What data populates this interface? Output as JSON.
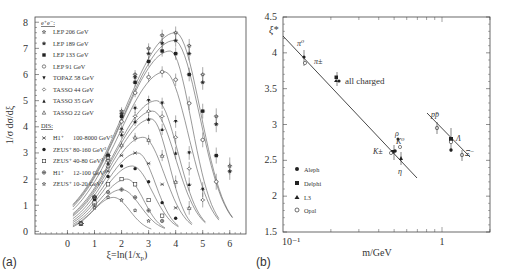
{
  "chart_data": [
    {
      "panel": "(a)",
      "type": "scatter",
      "title": "",
      "xlabel": "ξ=ln(1/x_p)",
      "ylabel": "1/σ dσ/dξ",
      "xlim": [
        -1.2,
        6.6
      ],
      "ylim": [
        0,
        8
      ],
      "x_ticks": [
        "0",
        "1",
        "2",
        "3",
        "4",
        "5",
        "6"
      ],
      "y_ticks": [
        "0",
        "1",
        "2",
        "3",
        "4",
        "5",
        "6",
        "7",
        "8"
      ],
      "grid": false,
      "legend_position": "upper-left",
      "legend_groups": [
        {
          "heading": "e⁺e⁻:",
          "entries": [
            {
              "marker": "star-open",
              "label": "LEP 206 GeV"
            },
            {
              "marker": "star-filled",
              "label": "LEP 189 GeV"
            },
            {
              "marker": "square-filled",
              "label": "LEP 133 GeV"
            },
            {
              "marker": "circle-open",
              "label": "LEP 91 GeV"
            },
            {
              "marker": "triangle-down-filled",
              "label": "TOPAZ 58 GeV"
            },
            {
              "marker": "diamond-open",
              "label": "TASSO 44 GeV"
            },
            {
              "marker": "triangle-up-filled",
              "label": "TASSO 35 GeV"
            },
            {
              "marker": "triangle-up-open",
              "label": "TASSO 22 GeV"
            }
          ]
        },
        {
          "heading": "DIS:",
          "entries": [
            {
              "marker": "asterisk",
              "label": "H1⁺",
              "range": "100-8000 GeV²"
            },
            {
              "marker": "circle-filled",
              "label": "ZEUS⁺",
              "range": "80-160 GeV²"
            },
            {
              "marker": "square-open",
              "label": "ZEUS⁺",
              "range": "40-80 GeV²"
            },
            {
              "marker": "cross-open",
              "label": "H1⁺",
              "range": "12-100 GeV²"
            },
            {
              "marker": "star-open",
              "label": "ZEUS⁺",
              "range": "10-20 GeV²"
            }
          ]
        }
      ],
      "series": [
        {
          "name": "LEP 206 GeV",
          "peak_x": 4.0,
          "peak_y": 7.6,
          "x": [
            0.5,
            1.0,
            1.5,
            2.0,
            2.5,
            3.0,
            3.5,
            4.0,
            4.5,
            5.0,
            5.5,
            6.0
          ],
          "y": [
            0.3,
            1.3,
            2.9,
            4.6,
            6.0,
            7.0,
            7.5,
            7.6,
            7.1,
            6.0,
            4.4,
            2.5
          ]
        },
        {
          "name": "LEP 189 GeV",
          "peak_x": 3.95,
          "peak_y": 7.3,
          "x": [
            0.5,
            1.0,
            1.5,
            2.0,
            2.5,
            3.0,
            3.5,
            4.0,
            4.5,
            5.0,
            5.5,
            6.0
          ],
          "y": [
            0.3,
            1.3,
            2.9,
            4.5,
            5.9,
            6.8,
            7.2,
            7.3,
            6.8,
            5.7,
            4.1,
            2.3
          ]
        },
        {
          "name": "LEP 133 GeV",
          "peak_x": 3.8,
          "peak_y": 6.9,
          "x": [
            0.5,
            1.0,
            1.5,
            2.0,
            2.5,
            3.0,
            3.5,
            4.0,
            4.5,
            5.0,
            5.5
          ],
          "y": [
            0.3,
            1.3,
            2.9,
            4.4,
            5.7,
            6.5,
            6.9,
            6.8,
            6.0,
            4.6,
            2.9
          ]
        },
        {
          "name": "LEP 91 GeV",
          "peak_x": 3.6,
          "peak_y": 6.1,
          "x": [
            0.5,
            1.0,
            1.5,
            2.0,
            2.5,
            3.0,
            3.5,
            4.0,
            4.5,
            5.0,
            5.5
          ],
          "y": [
            0.3,
            1.3,
            2.8,
            4.2,
            5.3,
            5.9,
            6.1,
            5.8,
            4.9,
            3.5,
            1.9
          ]
        },
        {
          "name": "TOPAZ 58 GeV",
          "peak_x": 3.3,
          "peak_y": 5.0,
          "x": [
            0.5,
            1.0,
            1.5,
            2.0,
            2.5,
            3.0,
            3.5,
            4.0,
            4.5,
            5.0
          ],
          "y": [
            0.3,
            1.3,
            2.7,
            3.9,
            4.7,
            5.0,
            4.9,
            4.2,
            3.0,
            1.6
          ]
        },
        {
          "name": "TASSO 44 GeV",
          "peak_x": 3.15,
          "peak_y": 4.6,
          "x": [
            0.5,
            1.0,
            1.5,
            2.0,
            2.5,
            3.0,
            3.5,
            4.0,
            4.5,
            5.0
          ],
          "y": [
            0.3,
            1.3,
            2.7,
            3.8,
            4.4,
            4.6,
            4.4,
            3.6,
            2.4,
            1.2
          ]
        },
        {
          "name": "TASSO 35 GeV",
          "peak_x": 3.1,
          "peak_y": 4.3,
          "x": [
            0.5,
            1.0,
            1.5,
            2.0,
            2.5,
            3.0,
            3.5,
            4.0,
            4.5
          ],
          "y": [
            0.3,
            1.3,
            2.6,
            3.7,
            4.2,
            4.3,
            3.9,
            3.0,
            1.8
          ]
        },
        {
          "name": "TASSO 22 GeV",
          "peak_x": 2.8,
          "peak_y": 3.6,
          "x": [
            0.5,
            1.0,
            1.5,
            2.0,
            2.5,
            3.0,
            3.5,
            4.0,
            4.5
          ],
          "y": [
            0.3,
            1.3,
            2.5,
            3.3,
            3.6,
            3.5,
            2.9,
            1.9,
            0.9
          ]
        },
        {
          "name": "H1 100-8000 GeV²",
          "peak_x": 2.6,
          "peak_y": 3.0,
          "x": [
            0.5,
            1.0,
            1.5,
            2.0,
            2.5,
            3.0,
            3.5,
            4.0
          ],
          "y": [
            0.3,
            1.3,
            2.3,
            2.9,
            3.0,
            2.6,
            1.8,
            0.9
          ]
        },
        {
          "name": "ZEUS 80-160 GeV²",
          "peak_x": 2.4,
          "peak_y": 2.5,
          "x": [
            0.5,
            1.0,
            1.5,
            2.0,
            2.5,
            3.0,
            3.5,
            4.0
          ],
          "y": [
            0.3,
            1.2,
            2.1,
            2.5,
            2.4,
            1.9,
            1.1,
            0.5
          ]
        },
        {
          "name": "ZEUS 40-80 GeV²",
          "peak_x": 2.2,
          "peak_y": 2.0,
          "x": [
            0.5,
            1.0,
            1.5,
            2.0,
            2.5,
            3.0,
            3.5
          ],
          "y": [
            0.3,
            1.1,
            1.8,
            2.0,
            1.8,
            1.2,
            0.6
          ]
        },
        {
          "name": "H1 12-100 GeV²",
          "peak_x": 2.0,
          "peak_y": 1.6,
          "x": [
            0.5,
            1.0,
            1.5,
            2.0,
            2.5,
            3.0,
            3.5
          ],
          "y": [
            0.3,
            1.0,
            1.5,
            1.6,
            1.3,
            0.8,
            0.4
          ]
        },
        {
          "name": "ZEUS 10-20 GeV²",
          "peak_x": 1.7,
          "peak_y": 1.3,
          "x": [
            0.5,
            1.0,
            1.5,
            2.0,
            2.5,
            3.0
          ],
          "y": [
            0.3,
            0.9,
            1.3,
            1.2,
            0.8,
            0.4
          ]
        }
      ]
    },
    {
      "panel": "(b)",
      "type": "scatter",
      "title": "",
      "xlabel": "m/GeV",
      "ylabel": "ξ*",
      "xscale": "log",
      "xlim": [
        0.1,
        2.5
      ],
      "ylim": [
        1.5,
        4.5
      ],
      "x_ticks": [
        "10⁻¹",
        "1"
      ],
      "y_ticks": [
        "1.5",
        "2",
        "2.5",
        "3",
        "3.5",
        "4",
        "4.5"
      ],
      "grid": false,
      "legend_position": "lower-left",
      "legend": [
        {
          "marker": "circle-filled",
          "label": "Aleph"
        },
        {
          "marker": "square-filled",
          "label": "Delphi"
        },
        {
          "marker": "triangle-up-filled",
          "label": "L3"
        },
        {
          "marker": "circle-open",
          "label": "Opal"
        }
      ],
      "fit_lines": [
        {
          "name": "meson fit",
          "x": [
            0.1,
            0.7
          ],
          "y": [
            4.2,
            2.25
          ]
        },
        {
          "name": "baryon fit",
          "x": [
            0.85,
            1.65
          ],
          "y": [
            3.28,
            2.5
          ]
        }
      ],
      "annotations": [
        {
          "text": "π⁰",
          "x": 0.135,
          "y": 3.95
        },
        {
          "text": "π±",
          "x": 0.14,
          "y": 3.8
        },
        {
          "text": "all charged",
          "x": 0.25,
          "y": 3.62
        },
        {
          "text": "K±",
          "x": 0.49,
          "y": 2.75
        },
        {
          "text": "ρ",
          "x": 0.77,
          "y": 2.95
        },
        {
          "text": "K⁰",
          "x": 0.5,
          "y": 2.82
        },
        {
          "text": "η",
          "x": 0.55,
          "y": 2.55
        },
        {
          "text": "pp̄",
          "x": 0.94,
          "y": 3.05
        },
        {
          "text": "Λ",
          "x": 1.12,
          "y": 2.75
        },
        {
          "text": "Ξ⁻",
          "x": 1.32,
          "y": 2.55
        }
      ],
      "points": [
        {
          "label": "π⁰",
          "x": 0.135,
          "y": 3.92
        },
        {
          "label": "π±",
          "x": 0.14,
          "y": 3.85
        },
        {
          "label": "all charged",
          "x": 0.24,
          "y": 3.65
        },
        {
          "label": "K±",
          "x": 0.49,
          "y": 2.72
        },
        {
          "label": "K⁰",
          "x": 0.5,
          "y": 2.75
        },
        {
          "label": "η",
          "x": 0.55,
          "y": 2.58
        },
        {
          "label": "ρ",
          "x": 0.77,
          "y": 2.9
        },
        {
          "label": "pp̄",
          "x": 0.94,
          "y": 3.0
        },
        {
          "label": "Λ",
          "x": 1.12,
          "y": 2.78
        },
        {
          "label": "Ξ⁻",
          "x": 1.32,
          "y": 2.6
        }
      ]
    }
  ],
  "panels": {
    "a": {
      "label": "(a)",
      "xlabel": "ξ=ln(1/x",
      "xlabel_sub": "p",
      "xlabel_end": ")",
      "ylabel": "1/σ dσ/dξ",
      "legend_ee_heading": "e⁺e⁻:",
      "legend_dis_heading": "DIS:",
      "legend": [
        {
          "label": "LEP 206 GeV"
        },
        {
          "label": "LEP 189 GeV"
        },
        {
          "label": "LEP 133 GeV"
        },
        {
          "label": "LEP 91 GeV"
        },
        {
          "label": "TOPAZ 58 GeV"
        },
        {
          "label": "TASSO 44 GeV"
        },
        {
          "label": "TASSO 35 GeV"
        },
        {
          "label": "TASSO 22 GeV"
        }
      ],
      "dis_legend": [
        {
          "label": "H1⁺",
          "range": "100-8000 GeV²"
        },
        {
          "label": "ZEUS⁺",
          "range": "80-160 GeV²"
        },
        {
          "label": "ZEUS⁺",
          "range": "40-80 GeV²"
        },
        {
          "label": "H1⁺",
          "range": "12-100 GeV²"
        },
        {
          "label": "ZEUS⁺",
          "range": "10-20 GeV²"
        }
      ],
      "x_ticks": [
        "0",
        "1",
        "2",
        "3",
        "4",
        "5",
        "6"
      ],
      "y_ticks": [
        "0",
        "1",
        "2",
        "3",
        "4",
        "5",
        "6",
        "7",
        "8"
      ]
    },
    "b": {
      "label": "(b)",
      "xlabel": "m/GeV",
      "ylabel": "ξ*",
      "x_tick_min": "10⁻¹",
      "x_tick_one": "1",
      "y_ticks": [
        "1.5",
        "2",
        "2.5",
        "3",
        "3.5",
        "4",
        "4.5"
      ],
      "legend": [
        {
          "label": "Aleph"
        },
        {
          "label": "Delphi"
        },
        {
          "label": "L3"
        },
        {
          "label": "Opal"
        }
      ],
      "ann": {
        "pi0": "π⁰",
        "pipm": "π±",
        "all_charged": "all charged",
        "kpm": "K±",
        "rho": "ρ",
        "k0": "K⁰",
        "eta": "η",
        "ppbar": "pp̄",
        "lambda": "Λ",
        "xi": "Ξ⁻"
      }
    }
  }
}
